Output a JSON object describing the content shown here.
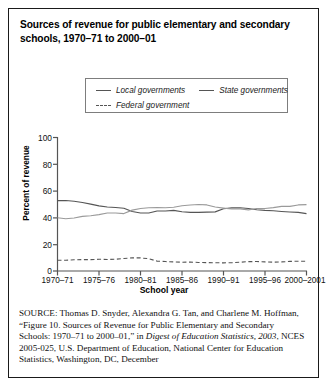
{
  "figure": {
    "title": "Sources of revenue for public elementary and secondary schools, 1970–71 to 2000–01",
    "border_color": "#1a1a1a"
  },
  "legend": {
    "position": "top-center",
    "items": [
      {
        "label": "Local governments",
        "style": "solid",
        "color": "#555555",
        "swatch_icon": "line-solid-icon"
      },
      {
        "label": "State governments",
        "style": "solid",
        "color": "#888888",
        "swatch_icon": "line-solid-icon"
      },
      {
        "label": "Federal government",
        "style": "dashed",
        "color": "#555555",
        "swatch_icon": "line-dashed-icon"
      }
    ]
  },
  "axes": {
    "ylabel": "Percent of revenue",
    "xlabel": "School year",
    "yticks": [
      "100",
      "80",
      "60",
      "40",
      "20",
      "0"
    ],
    "ylim": [
      0,
      100
    ],
    "xticks": [
      "1970–71",
      "1975–76",
      "1980–81",
      "1985–86",
      "1990–91",
      "1995–96",
      "2000–2001"
    ],
    "grid": false
  },
  "chart_data": {
    "type": "line",
    "title": "Sources of revenue for public elementary and secondary schools, 1970–71 to 2000–01",
    "xlabel": "School year",
    "ylabel": "Percent of revenue",
    "ylim": [
      0,
      100
    ],
    "xlim": [
      1970,
      2000
    ],
    "grid": false,
    "legend_position": "top-center",
    "x": [
      1970,
      1971,
      1972,
      1973,
      1974,
      1975,
      1976,
      1977,
      1978,
      1979,
      1980,
      1981,
      1982,
      1983,
      1984,
      1985,
      1986,
      1987,
      1988,
      1989,
      1990,
      1991,
      1992,
      1993,
      1994,
      1995,
      1996,
      1997,
      1998,
      1999,
      2000
    ],
    "x_tick_labels": [
      "1970–71",
      "1975–76",
      "1980–81",
      "1985–86",
      "1990–91",
      "1995–96",
      "2000–2001"
    ],
    "series": [
      {
        "name": "Local governments",
        "style": "solid",
        "color": "#555555",
        "values": [
          52.7,
          52.8,
          52.3,
          51.3,
          50.1,
          48.8,
          47.9,
          47.6,
          47.0,
          44.6,
          43.4,
          43.4,
          44.9,
          45.0,
          45.4,
          44.4,
          43.9,
          43.9,
          44.1,
          44.3,
          46.6,
          47.3,
          47.4,
          46.8,
          45.9,
          45.4,
          45.1,
          44.6,
          44.2,
          43.9,
          43.0
        ]
      },
      {
        "name": "State governments",
        "style": "solid",
        "color": "#888888",
        "values": [
          39.9,
          39.1,
          39.7,
          40.9,
          41.4,
          42.2,
          43.4,
          43.4,
          43.0,
          45.6,
          46.8,
          47.4,
          47.6,
          47.4,
          47.8,
          48.9,
          49.4,
          49.8,
          49.5,
          47.9,
          47.1,
          46.4,
          46.4,
          45.8,
          46.8,
          46.8,
          47.5,
          48.4,
          48.4,
          49.5,
          49.7
        ]
      },
      {
        "name": "Federal government",
        "style": "dashed",
        "color": "#555555",
        "values": [
          8.0,
          8.1,
          8.4,
          8.5,
          8.5,
          8.8,
          8.6,
          8.8,
          9.4,
          9.8,
          9.8,
          9.2,
          7.4,
          7.1,
          6.8,
          6.6,
          6.7,
          6.4,
          6.3,
          6.2,
          6.1,
          6.2,
          6.6,
          7.0,
          7.1,
          6.8,
          6.6,
          6.8,
          7.2,
          7.3,
          7.3
        ]
      }
    ]
  },
  "source_note": {
    "label": "SOURCE:",
    "text_before_italic": " Thomas D. Snyder, Alexandra G. Tan, and Charlene M. Hoffman, “Figure 10. Sources of Revenue for Public Elementary and Secondary Schools: 1970–71 to 2000–01,” in ",
    "italic_text": "Digest of Education Statistics, 2003",
    "text_after_italic": ", NCES 2005-025, U.S. Department of Education, National Center for Education Statistics, Washington, DC, December"
  }
}
